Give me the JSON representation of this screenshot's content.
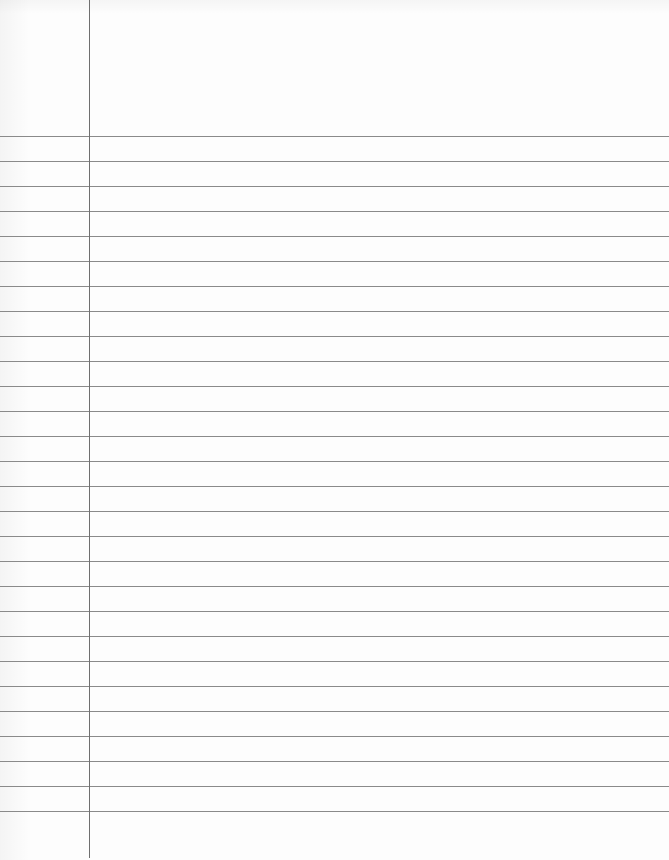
{
  "document": {
    "type": "lined-paper",
    "width": 669,
    "height": 860,
    "background_color": "#fdfdfd",
    "margin_line": {
      "x": 89,
      "color": "#6f6f6f"
    },
    "ruled_lines": {
      "count": 28,
      "first_y": 136,
      "spacing": 25,
      "color": "#8a8a8a"
    },
    "text_content": ""
  }
}
